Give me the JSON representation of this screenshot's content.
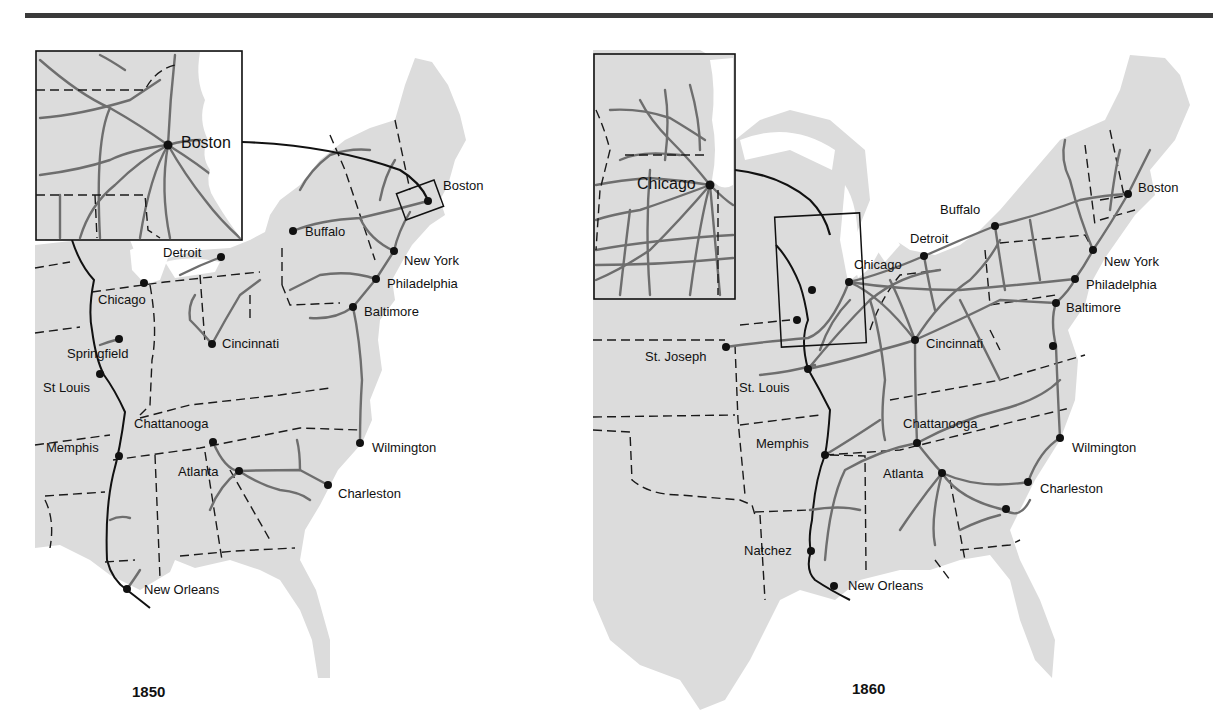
{
  "maps": [
    {
      "year": "1850",
      "inset_label": "Boston",
      "cities": [
        {
          "name": "Boston",
          "x": 428,
          "y": 201
        },
        {
          "name": "Buffalo",
          "x": 293,
          "y": 231
        },
        {
          "name": "New York",
          "x": 394,
          "y": 251
        },
        {
          "name": "Philadelphia",
          "x": 376,
          "y": 279
        },
        {
          "name": "Baltimore",
          "x": 353,
          "y": 307
        },
        {
          "name": "Detroit",
          "x": 221,
          "y": 257
        },
        {
          "name": "Chicago",
          "x": 144,
          "y": 283
        },
        {
          "name": "Springfield",
          "x": 119,
          "y": 339
        },
        {
          "name": "Cincinnati",
          "x": 212,
          "y": 344
        },
        {
          "name": "St Louis",
          "x": 100,
          "y": 374
        },
        {
          "name": "Chattanooga",
          "x": 213,
          "y": 442
        },
        {
          "name": "Memphis",
          "x": 119,
          "y": 456
        },
        {
          "name": "Atlanta",
          "x": 239,
          "y": 471
        },
        {
          "name": "Wilmington",
          "x": 360,
          "y": 443
        },
        {
          "name": "Charleston",
          "x": 328,
          "y": 485
        },
        {
          "name": "New Orleans",
          "x": 127,
          "y": 589
        }
      ]
    },
    {
      "year": "1860",
      "inset_label": "Chicago",
      "cities": [
        {
          "name": "Boston",
          "x": 1128,
          "y": 194
        },
        {
          "name": "Buffalo",
          "x": 995,
          "y": 226
        },
        {
          "name": "Detroit",
          "x": 924,
          "y": 256
        },
        {
          "name": "Chicago",
          "x": 849,
          "y": 282
        },
        {
          "name": "New York",
          "x": 1093,
          "y": 250
        },
        {
          "name": "Philadelphia",
          "x": 1075,
          "y": 279
        },
        {
          "name": "Baltimore",
          "x": 1056,
          "y": 303
        },
        {
          "name": "Cincinnati",
          "x": 915,
          "y": 340
        },
        {
          "name": "St. Joseph",
          "x": 726,
          "y": 347
        },
        {
          "name": "St. Louis",
          "x": 808,
          "y": 369
        },
        {
          "name": "Chattanooga",
          "x": 917,
          "y": 443
        },
        {
          "name": "Memphis",
          "x": 825,
          "y": 455
        },
        {
          "name": "Atlanta",
          "x": 942,
          "y": 473
        },
        {
          "name": "Wilmington",
          "x": 1060,
          "y": 438
        },
        {
          "name": "Charleston",
          "x": 1028,
          "y": 482
        },
        {
          "name": "Natchez",
          "x": 811,
          "y": 551
        },
        {
          "name": "New Orleans",
          "x": 834,
          "y": 586
        }
      ]
    }
  ]
}
